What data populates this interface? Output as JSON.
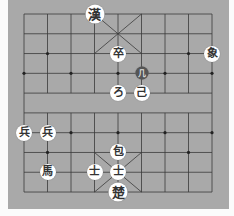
{
  "board": {
    "cols": 9,
    "rows": 10,
    "origin_x": 24,
    "origin_y": 14,
    "step_x": 23.5,
    "step_y": 19.78,
    "colors": {
      "board": "#a9a9a9",
      "line": "#3a3a3a",
      "piece": "#ffffff",
      "dark_piece": "#555555"
    }
  },
  "pieces": [
    {
      "label": "漢",
      "col": 3,
      "row": 0,
      "style": "big"
    },
    {
      "label": "卒",
      "col": 4,
      "row": 2,
      "style": ""
    },
    {
      "label": "象",
      "col": 8,
      "row": 2,
      "style": ""
    },
    {
      "label": "几",
      "col": 5,
      "row": 3,
      "style": "dark"
    },
    {
      "label": "ろ",
      "col": 4,
      "row": 4,
      "style": ""
    },
    {
      "label": "己",
      "col": 5,
      "row": 4,
      "style": ""
    },
    {
      "label": "兵",
      "col": 0,
      "row": 6,
      "style": ""
    },
    {
      "label": "兵",
      "col": 1,
      "row": 6,
      "style": ""
    },
    {
      "label": "包",
      "col": 4,
      "row": 7,
      "style": ""
    },
    {
      "label": "馬",
      "col": 1,
      "row": 8,
      "style": ""
    },
    {
      "label": "士",
      "col": 3,
      "row": 8,
      "style": ""
    },
    {
      "label": "士",
      "col": 4,
      "row": 8,
      "style": ""
    },
    {
      "label": "楚",
      "col": 4,
      "row": 9,
      "style": "big"
    }
  ]
}
